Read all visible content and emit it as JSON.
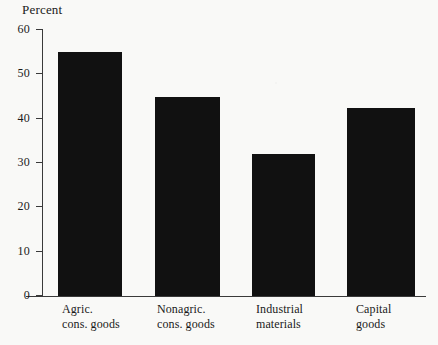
{
  "chart_data": {
    "type": "bar",
    "title": "",
    "subtitle": "",
    "ylabel": "Percent",
    "xlabel": "",
    "categories": [
      "Agric. cons. goods",
      "Nonagric. cons. goods",
      "Industrial materials",
      "Capital goods"
    ],
    "category_lines": [
      [
        "Agric.",
        "cons. goods"
      ],
      [
        "Nonagric.",
        "cons. goods"
      ],
      [
        "Industrial",
        "materials"
      ],
      [
        "Capital",
        "goods"
      ]
    ],
    "values": [
      55,
      45,
      32,
      42.5
    ],
    "ylim": [
      0,
      60
    ],
    "yticks": [
      0,
      10,
      20,
      30,
      40,
      50,
      60
    ],
    "ytick_labels": [
      "0",
      "10",
      "20",
      "30",
      "40",
      "50",
      "60"
    ],
    "grid": false,
    "legend": false,
    "legend_position": "none",
    "bar_color": "#111111",
    "axis_color": "#3a3a3a",
    "background_color": "#f9f9f7"
  }
}
